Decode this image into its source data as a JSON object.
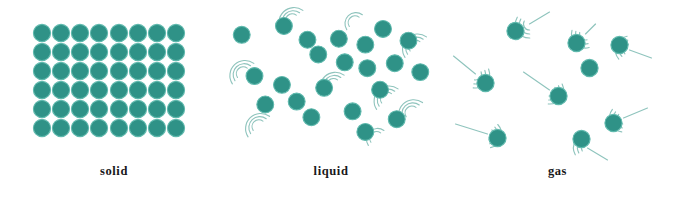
{
  "figure": {
    "background_color": "#ffffff",
    "particle_color": "#2f9287",
    "particle_edge_color": "#5fb9ad",
    "motion_line_color": "#8fc4bd",
    "label_color": "#19181a",
    "width": 681,
    "height": 202
  },
  "panels": [
    {
      "id": "solid",
      "label": "solid",
      "arrangement": "regular-grid",
      "columns": 8,
      "rows": 6,
      "particle_count": 48,
      "particle_radius": 8.6,
      "spacing_x": 19.2,
      "spacing_y": 19.2,
      "grid_origin_x": 42,
      "grid_origin_y": 33,
      "has_motion_lines": false,
      "description": "Particles packed in a close, ordered lattice; fixed positions, vibrating in place."
    },
    {
      "id": "liquid",
      "label": "liquid",
      "arrangement": "close-packed-disordered",
      "particle_count": 22,
      "particle_radius": 8.6,
      "has_motion_lines": true,
      "motion_line_style": "short-curved-arcs",
      "description": "Particles close together but randomly arranged; able to slide past one another."
    },
    {
      "id": "gas",
      "label": "gas",
      "arrangement": "sparse-random",
      "particle_count": 9,
      "particle_radius": 8.6,
      "has_motion_lines": true,
      "motion_line_style": "long-straight-trails-with-arcs",
      "description": "Particles far apart moving rapidly in straight lines in random directions."
    }
  ],
  "chart_data": {
    "type": "scatter",
    "xlabel": "",
    "ylabel": "",
    "legend": [
      "solid",
      "liquid",
      "gas"
    ],
    "series": [
      {
        "name": "solid",
        "particle_radius": 8.6,
        "points": [
          [
            42,
            33
          ],
          [
            61,
            33
          ],
          [
            80,
            33
          ],
          [
            99,
            33
          ],
          [
            119,
            33
          ],
          [
            138,
            33
          ],
          [
            157,
            33
          ],
          [
            176,
            33
          ],
          [
            42,
            52
          ],
          [
            61,
            52
          ],
          [
            80,
            52
          ],
          [
            99,
            52
          ],
          [
            119,
            52
          ],
          [
            138,
            52
          ],
          [
            157,
            52
          ],
          [
            176,
            52
          ],
          [
            42,
            71
          ],
          [
            61,
            71
          ],
          [
            80,
            71
          ],
          [
            99,
            71
          ],
          [
            119,
            71
          ],
          [
            138,
            71
          ],
          [
            157,
            71
          ],
          [
            176,
            71
          ],
          [
            42,
            90
          ],
          [
            61,
            90
          ],
          [
            80,
            90
          ],
          [
            99,
            90
          ],
          [
            119,
            90
          ],
          [
            138,
            90
          ],
          [
            157,
            90
          ],
          [
            176,
            90
          ],
          [
            42,
            109
          ],
          [
            61,
            109
          ],
          [
            80,
            109
          ],
          [
            99,
            109
          ],
          [
            119,
            109
          ],
          [
            138,
            109
          ],
          [
            157,
            109
          ],
          [
            176,
            109
          ],
          [
            42,
            128
          ],
          [
            61,
            128
          ],
          [
            80,
            128
          ],
          [
            99,
            128
          ],
          [
            119,
            128
          ],
          [
            138,
            128
          ],
          [
            157,
            128
          ],
          [
            176,
            128
          ]
        ],
        "motion_lines": []
      },
      {
        "name": "liquid",
        "particle_radius": 8.6,
        "points": [
          [
            14,
            34
          ],
          [
            57,
            25
          ],
          [
            81,
            39
          ],
          [
            113,
            38
          ],
          [
            140,
            44
          ],
          [
            92,
            54
          ],
          [
            158,
            28
          ],
          [
            184,
            40
          ],
          [
            27,
            76
          ],
          [
            55,
            85
          ],
          [
            119,
            62
          ],
          [
            142,
            68
          ],
          [
            170,
            63
          ],
          [
            98,
            88
          ],
          [
            155,
            90
          ],
          [
            38,
            105
          ],
          [
            70,
            102
          ],
          [
            85,
            118
          ],
          [
            127,
            112
          ],
          [
            140,
            133
          ],
          [
            172,
            120
          ],
          [
            196,
            72
          ]
        ],
        "motion_lines": [
          {
            "type": "arc",
            "cx": 64,
            "cy": 18,
            "sweeps": 3
          },
          {
            "type": "arc",
            "cx": 128,
            "cy": 20,
            "sweeps": 2
          },
          {
            "type": "arc",
            "cx": 190,
            "cy": 45,
            "sweeps": 3
          },
          {
            "type": "arc",
            "cx": 14,
            "cy": 72,
            "sweeps": 3
          },
          {
            "type": "arc",
            "cx": 106,
            "cy": 84,
            "sweeps": 3
          },
          {
            "type": "arc",
            "cx": 161,
            "cy": 98,
            "sweeps": 3
          },
          {
            "type": "arc",
            "cx": 30,
            "cy": 126,
            "sweeps": 3
          },
          {
            "type": "arc",
            "cx": 150,
            "cy": 138,
            "sweeps": 2
          },
          {
            "type": "arc",
            "cx": 186,
            "cy": 112,
            "sweeps": 3
          }
        ]
      },
      {
        "name": "gas",
        "particle_radius": 8.6,
        "points": [
          [
            78,
            31
          ],
          [
            139,
            43
          ],
          [
            182,
            45
          ],
          [
            152,
            68
          ],
          [
            48,
            83
          ],
          [
            121,
            96
          ],
          [
            60,
            138
          ],
          [
            144,
            139
          ],
          [
            176,
            123
          ]
        ],
        "motion_lines": [
          {
            "type": "trail",
            "x1": 112,
            "y1": 12,
            "x2": 92,
            "y2": 24
          },
          {
            "type": "trail",
            "x1": 158,
            "y1": 24,
            "x2": 148,
            "y2": 34
          },
          {
            "type": "trail",
            "x1": 16,
            "y1": 56,
            "x2": 38,
            "y2": 74
          },
          {
            "type": "trail",
            "x1": 86,
            "y1": 72,
            "x2": 112,
            "y2": 90
          },
          {
            "type": "trail",
            "x1": 214,
            "y1": 58,
            "x2": 192,
            "y2": 50
          },
          {
            "type": "trail",
            "x1": 18,
            "y1": 124,
            "x2": 50,
            "y2": 134
          },
          {
            "type": "trail",
            "x1": 210,
            "y1": 108,
            "x2": 186,
            "y2": 118
          },
          {
            "type": "trail",
            "x1": 170,
            "y1": 160,
            "x2": 150,
            "y2": 148
          }
        ]
      }
    ]
  }
}
